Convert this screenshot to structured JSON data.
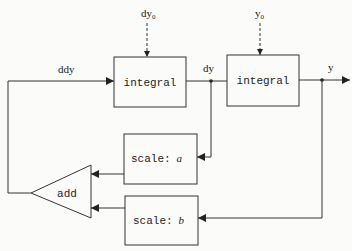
{
  "diagram": {
    "type": "block-diagram",
    "colors": {
      "line": "#333333",
      "background": "#fbfbfa",
      "text": "#222222"
    },
    "blocks": {
      "integral_1": {
        "label": "integral"
      },
      "integral_2": {
        "label": "integral"
      },
      "scale_a": {
        "prefix": "scale:",
        "param": "a"
      },
      "scale_b": {
        "prefix": "scale:",
        "param": "b"
      },
      "add": {
        "label": "add"
      }
    },
    "signals": {
      "ddy": "ddy",
      "dy": "dy",
      "y": "y",
      "dy0_base": "dy",
      "dy0_sub": "0",
      "y0_base": "y",
      "y0_sub": "0"
    }
  }
}
